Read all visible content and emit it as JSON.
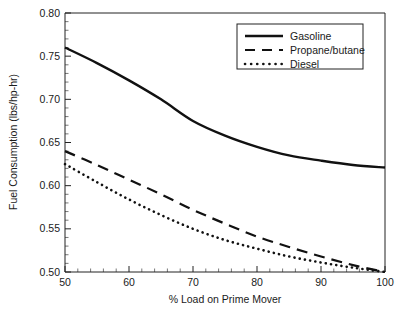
{
  "chart_data": {
    "type": "line",
    "title": "",
    "xlabel": "% Load on Prime Mover",
    "ylabel": "Fuel Consumption (lbs/hp-hr)",
    "xlim": [
      50,
      100
    ],
    "ylim": [
      0.5,
      0.8
    ],
    "xticks": [
      50,
      60,
      70,
      80,
      90,
      100
    ],
    "xtick_labels": [
      "50",
      "60",
      "70",
      "80",
      "90",
      "100"
    ],
    "yticks": [
      0.5,
      0.55,
      0.6,
      0.65,
      0.7,
      0.75,
      0.8
    ],
    "ytick_labels": [
      "0.50",
      "0.55",
      "0.60",
      "0.65",
      "0.70",
      "0.75",
      "0.80"
    ],
    "minor_ticks": true,
    "grid": false,
    "legend_position": "top-right",
    "x": [
      50,
      55,
      60,
      65,
      70,
      75,
      80,
      85,
      90,
      95,
      100
    ],
    "series": [
      {
        "name": "Gasoline",
        "style": "solid",
        "color": "#111111",
        "values": [
          0.76,
          0.742,
          0.722,
          0.7,
          0.675,
          0.658,
          0.645,
          0.635,
          0.629,
          0.624,
          0.621
        ]
      },
      {
        "name": "Propane/butane",
        "style": "dashed",
        "color": "#111111",
        "values": [
          0.64,
          0.624,
          0.607,
          0.59,
          0.572,
          0.556,
          0.541,
          0.529,
          0.518,
          0.508,
          0.5
        ]
      },
      {
        "name": "Diesel",
        "style": "dotted",
        "color": "#111111",
        "values": [
          0.625,
          0.604,
          0.584,
          0.566,
          0.55,
          0.537,
          0.527,
          0.518,
          0.511,
          0.505,
          0.5
        ]
      }
    ]
  },
  "legend": {
    "items": [
      {
        "label": "Gasoline",
        "style": "solid"
      },
      {
        "label": "Propane/butane",
        "style": "dashed"
      },
      {
        "label": "Diesel",
        "style": "dotted"
      }
    ]
  },
  "axes": {
    "x_title": "% Load on Prime Mover",
    "y_title": "Fuel Consumption (lbs/hp-hr)"
  }
}
